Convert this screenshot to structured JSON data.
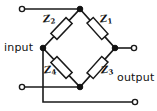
{
  "diagram": {
    "ports": {
      "input_label": "input",
      "output_label": "output"
    },
    "components": [
      {
        "id": "z1",
        "label": "Z",
        "subscript": "1",
        "type": "impedance",
        "arm": "top-right"
      },
      {
        "id": "z2",
        "label": "Z",
        "subscript": "2",
        "type": "impedance",
        "arm": "top-left"
      },
      {
        "id": "z3",
        "label": "Z",
        "subscript": "3",
        "type": "impedance",
        "arm": "bottom-right"
      },
      {
        "id": "z4",
        "label": "Z",
        "subscript": "4",
        "type": "impedance",
        "arm": "bottom-left"
      }
    ],
    "nodes": [
      {
        "id": "top",
        "x": 80,
        "y": 9
      },
      {
        "id": "left",
        "x": 43,
        "y": 48
      },
      {
        "id": "right",
        "x": 115,
        "y": 48
      },
      {
        "id": "bottom",
        "x": 80,
        "y": 87
      }
    ],
    "terminals": [
      {
        "id": "input-top",
        "x": 22,
        "y": 9
      },
      {
        "id": "input-bottom",
        "x": 22,
        "y": 87
      },
      {
        "id": "output-top",
        "x": 134,
        "y": 48
      },
      {
        "id": "output-bottom",
        "x": 135,
        "y": 102
      }
    ],
    "colors": {
      "line": "#1a1a1a",
      "fill": "#ffffff",
      "background": "#ffffff",
      "text": "#111111"
    }
  }
}
